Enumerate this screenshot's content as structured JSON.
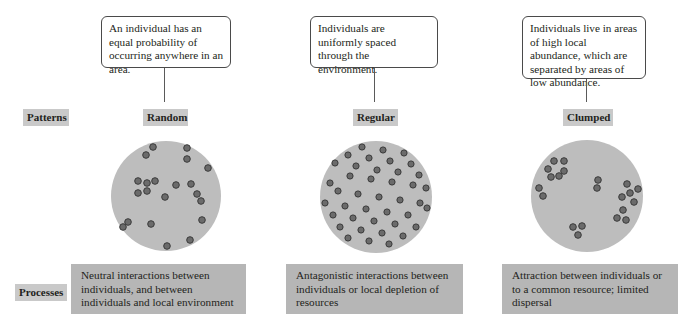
{
  "row_labels": {
    "patterns": "Patterns",
    "processes": "Processes"
  },
  "columns": [
    {
      "pattern": "Random",
      "description": "An individual has an equal probability of occurring anywhere in an area.",
      "process": "Neutral interactions between individuals, and between individuals and local environment"
    },
    {
      "pattern": "Regular",
      "description": "Individuals are uniformly spaced through the environment.",
      "process": "Antagonistic interactions between individuals or local depletion of resources"
    },
    {
      "pattern": "Clumped",
      "description": "Individuals live in areas of high local abundance, which are separated by areas of low abundance.",
      "process": "Attraction between individuals or to a common resource; limited dispersal"
    }
  ],
  "colors": {
    "area_fill": "#bdbdbd",
    "individual_fill": "#6b6b6b",
    "individual_stroke": "#3a3a3a",
    "label_bg": "#c9c9c9",
    "process_bg": "#b6b6b6"
  }
}
